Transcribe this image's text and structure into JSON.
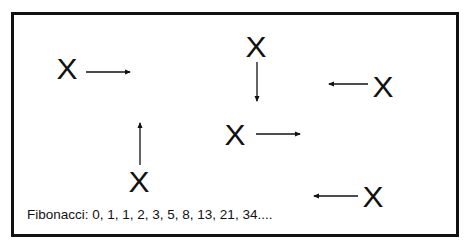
{
  "diagram": {
    "title": "",
    "marks": [
      {
        "id": "x1",
        "label": "X",
        "x": 57,
        "y": 54,
        "arrow": {
          "direction": "right",
          "x1": 86,
          "y1": 72,
          "x2": 130,
          "y2": 72
        }
      },
      {
        "id": "x2",
        "label": "X",
        "x": 246,
        "y": 32,
        "arrow": {
          "direction": "down",
          "x1": 257,
          "y1": 62,
          "x2": 257,
          "y2": 101
        }
      },
      {
        "id": "x3",
        "label": "X",
        "x": 373,
        "y": 72,
        "arrow": {
          "direction": "left",
          "x1": 368,
          "y1": 84,
          "x2": 329,
          "y2": 84
        }
      },
      {
        "id": "x4",
        "label": "X",
        "x": 225,
        "y": 120,
        "arrow": {
          "direction": "right",
          "x1": 256,
          "y1": 134,
          "x2": 300,
          "y2": 134
        }
      },
      {
        "id": "x5",
        "label": "X",
        "x": 129,
        "y": 167,
        "arrow": {
          "direction": "up",
          "x1": 140,
          "y1": 165,
          "x2": 140,
          "y2": 123
        }
      },
      {
        "id": "x6",
        "label": "X",
        "x": 363,
        "y": 182,
        "arrow": {
          "direction": "left",
          "x1": 358,
          "y1": 196,
          "x2": 314,
          "y2": 196
        }
      }
    ],
    "caption": "Fibonacci: 0, 1, 1, 2, 3, 5, 8, 13, 21, 34....",
    "colors": {
      "ink": "#111111",
      "background": "#ffffff"
    }
  }
}
